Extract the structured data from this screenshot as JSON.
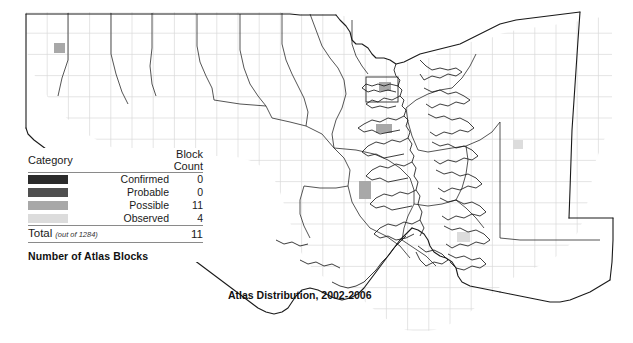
{
  "map": {
    "title": "Atlas Distribution, 2002-2006",
    "region_name": "Maryland",
    "grid": {
      "cell_size_px": 21.2,
      "origin_x": 26,
      "origin_y": 12,
      "line_color": "#d9d9d9"
    },
    "outline_color": "#1a1a1a",
    "background_color": "#ffffff",
    "blocks": [
      {
        "x": 54,
        "y": 43,
        "w": 11,
        "h": 10,
        "category": "Possible"
      },
      {
        "x": 379,
        "y": 82,
        "w": 12,
        "h": 9,
        "category": "Possible"
      },
      {
        "x": 376,
        "y": 124,
        "w": 16,
        "h": 9,
        "category": "Possible"
      },
      {
        "x": 359,
        "y": 181,
        "w": 12,
        "h": 18,
        "category": "Possible"
      },
      {
        "x": 457,
        "y": 232,
        "w": 13,
        "h": 10,
        "category": "Observed"
      },
      {
        "x": 513,
        "y": 140,
        "w": 10,
        "h": 9,
        "category": "Observed"
      }
    ]
  },
  "legend": {
    "header": {
      "category_label": "Category",
      "count_label": "Block Count"
    },
    "rows": [
      {
        "label": "Confirmed",
        "count": "0",
        "color": "#2b2b2b"
      },
      {
        "label": "Probable",
        "count": "0",
        "color": "#4f4f4f"
      },
      {
        "label": "Possible",
        "count": "11",
        "color": "#a8a8a8"
      },
      {
        "label": "Observed",
        "count": "4",
        "color": "#dcdcdc"
      }
    ],
    "total": {
      "label": "Total",
      "note": "(out of 1284)",
      "value": "11"
    },
    "caption": "Number of Atlas Blocks"
  }
}
